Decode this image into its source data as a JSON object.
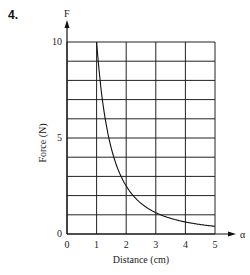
{
  "question_number": "4.",
  "chart_data": {
    "type": "line",
    "title": "",
    "xlabel": "Distance (cm)",
    "ylabel": "Force (N)",
    "x_axis_symbol": "α",
    "y_axis_symbol": "F",
    "xlim": [
      0,
      5
    ],
    "ylim": [
      0,
      10
    ],
    "x_ticks": [
      "0",
      "1",
      "2",
      "3",
      "4",
      "5"
    ],
    "y_ticks": [
      "0",
      "5",
      "10"
    ],
    "grid": true,
    "grid_x_step": 1,
    "grid_y_step": 1,
    "series": [
      {
        "name": "F = 10/x²",
        "x": [
          1.0,
          1.25,
          1.5,
          1.75,
          2.0,
          2.5,
          3.0,
          3.5,
          4.0,
          4.5,
          5.0
        ],
        "values": [
          10.0,
          6.4,
          4.44,
          3.27,
          2.5,
          1.6,
          1.11,
          0.82,
          0.63,
          0.49,
          0.4
        ]
      }
    ],
    "legend": null
  }
}
